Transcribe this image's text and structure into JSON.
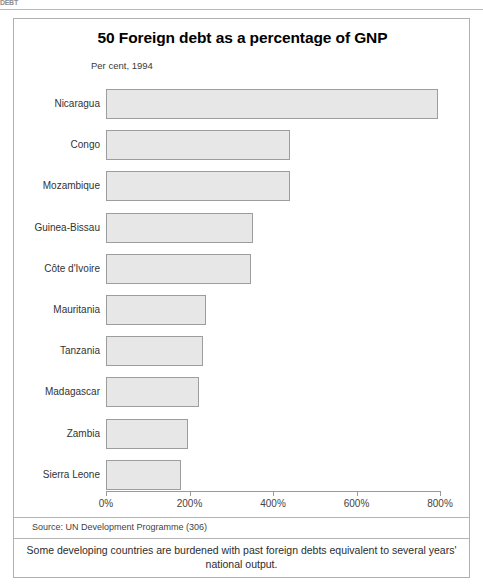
{
  "page_header": "DEBT",
  "figure": {
    "title": "50 Foreign debt as a percentage of GNP",
    "subtitle": "Per cent, 1994",
    "source": "Source: UN Development Programme (306)",
    "caption": "Some developing countries are burdened with past foreign debts equivalent to several years' national output."
  },
  "chart_data": {
    "type": "bar",
    "orientation": "horizontal",
    "title": "50 Foreign debt as a percentage of GNP",
    "subtitle": "Per cent, 1994",
    "xlabel": "",
    "ylabel": "",
    "xlim": [
      0,
      800
    ],
    "grid": false,
    "legend": null,
    "tick_labels": [
      "0%",
      "200%",
      "400%",
      "600%",
      "800%"
    ],
    "tick_values": [
      0,
      200,
      400,
      600,
      800
    ],
    "categories": [
      "Nicaragua",
      "Congo",
      "Mozambique",
      "Guinea-Bissau",
      "Côte d'Ivoire",
      "Mauritania",
      "Tanzania",
      "Madagascar",
      "Zambia",
      "Sierra Leone"
    ],
    "values": [
      795,
      440,
      440,
      352,
      348,
      240,
      232,
      222,
      196,
      180
    ],
    "bar_color": "#e7e7e7",
    "bar_border_color": "#9d9d9d"
  }
}
